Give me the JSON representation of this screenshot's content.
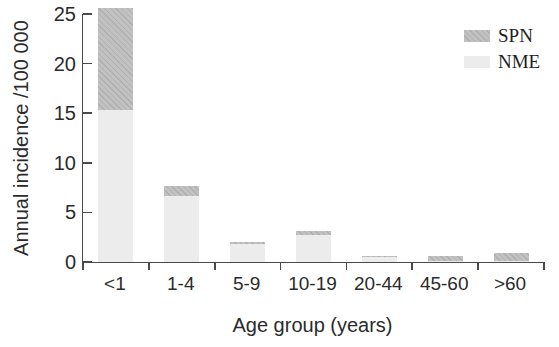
{
  "chart_data": {
    "type": "bar",
    "stacked": true,
    "title": "",
    "xlabel": "Age group (years)",
    "ylabel": "Annual incidence /100 000",
    "categories": [
      "<1",
      "1-4",
      "5-9",
      "10-19",
      "20-44",
      "45-60",
      ">60"
    ],
    "series": [
      {
        "name": "NME",
        "color": "#ececec",
        "values": [
          15.3,
          6.7,
          1.8,
          2.7,
          0.5,
          0.1,
          0.1
        ]
      },
      {
        "name": "SPN",
        "color": "#c1c1c1",
        "values": [
          10.3,
          1.0,
          0.2,
          0.4,
          0.1,
          0.5,
          0.8
        ]
      }
    ],
    "legend": [
      "SPN",
      "NME"
    ],
    "legend_position": "top-right",
    "ylim": [
      0,
      25
    ],
    "yticks": [
      0,
      5,
      10,
      15,
      20,
      25
    ],
    "grid": false,
    "axis_color": "#4a4a4a"
  }
}
